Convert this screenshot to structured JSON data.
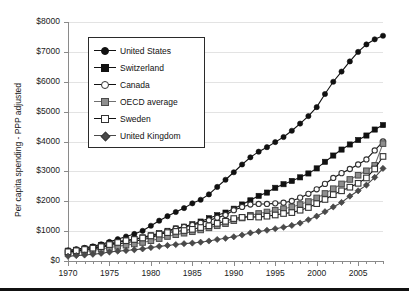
{
  "chart_data": {
    "type": "line",
    "title": "",
    "xlabel": "",
    "ylabel": "Per capita spending - PPP adjusted",
    "xlim": [
      1970,
      2008
    ],
    "ylim": [
      0,
      8000
    ],
    "grid": true,
    "legend_position": "upper-left-inside",
    "y_tick_labels": [
      "$8000",
      "$7000",
      "$6000",
      "$5000",
      "$4000",
      "$3000",
      "$2000",
      "$1000",
      "$0"
    ],
    "y_tick_values": [
      8000,
      7000,
      6000,
      5000,
      4000,
      3000,
      2000,
      1000,
      0
    ],
    "x_tick_labels": [
      "1970",
      "1975",
      "1980",
      "1985",
      "1990",
      "1995",
      "2000",
      "2005"
    ],
    "x_tick_values": [
      1970,
      1975,
      1980,
      1985,
      1990,
      1995,
      2000,
      2005
    ],
    "x": [
      1970,
      1971,
      1972,
      1973,
      1974,
      1975,
      1976,
      1977,
      1978,
      1979,
      1980,
      1981,
      1982,
      1983,
      1984,
      1985,
      1986,
      1987,
      1988,
      1989,
      1990,
      1991,
      1992,
      1993,
      1994,
      1995,
      1996,
      1997,
      1998,
      1999,
      2000,
      2001,
      2002,
      2003,
      2004,
      2005,
      2006,
      2007,
      2008
    ],
    "series": [
      {
        "name": "United States",
        "marker": "filled-circle",
        "color": "#111111",
        "values": [
          355,
          395,
          440,
          490,
          560,
          640,
          730,
          820,
          905,
          1010,
          1180,
          1350,
          1500,
          1640,
          1770,
          1930,
          2050,
          2230,
          2480,
          2720,
          2970,
          3230,
          3470,
          3660,
          3810,
          3980,
          4150,
          4360,
          4600,
          4850,
          5150,
          5590,
          6000,
          6340,
          6680,
          7000,
          7250,
          7420,
          7540
        ]
      },
      {
        "name": "Switzerland",
        "marker": "filled-square",
        "color": "#111111",
        "values": [
          345,
          375,
          420,
          470,
          530,
          600,
          650,
          690,
          730,
          790,
          860,
          930,
          1010,
          1090,
          1150,
          1230,
          1320,
          1430,
          1530,
          1620,
          1750,
          1890,
          2030,
          2180,
          2290,
          2450,
          2570,
          2680,
          2800,
          2930,
          3100,
          3320,
          3530,
          3730,
          3900,
          4050,
          4200,
          4400,
          4550
        ]
      },
      {
        "name": "Canada",
        "marker": "open-circle",
        "color": "#333333",
        "values": [
          300,
          330,
          360,
          400,
          450,
          520,
          570,
          610,
          660,
          710,
          780,
          880,
          990,
          1080,
          1140,
          1200,
          1280,
          1360,
          1450,
          1540,
          1700,
          1810,
          1890,
          1910,
          1910,
          1930,
          1950,
          2010,
          2120,
          2250,
          2400,
          2580,
          2780,
          2940,
          3080,
          3230,
          3400,
          3700,
          4000
        ]
      },
      {
        "name": "OECD average",
        "marker": "gray-square",
        "color": "#8e8e8e",
        "values": [
          265,
          290,
          320,
          355,
          400,
          450,
          490,
          530,
          570,
          620,
          680,
          750,
          820,
          880,
          930,
          980,
          1040,
          1110,
          1180,
          1250,
          1350,
          1440,
          1530,
          1590,
          1640,
          1700,
          1750,
          1810,
          1890,
          1990,
          2110,
          2260,
          2420,
          2580,
          2730,
          2870,
          3020,
          3200,
          3930
        ]
      },
      {
        "name": "Sweden",
        "marker": "open-square",
        "color": "#333333",
        "values": [
          310,
          345,
          385,
          430,
          480,
          550,
          620,
          680,
          720,
          770,
          840,
          900,
          950,
          990,
          1020,
          1060,
          1120,
          1180,
          1260,
          1330,
          1420,
          1460,
          1480,
          1470,
          1500,
          1540,
          1590,
          1620,
          1700,
          1790,
          1920,
          2060,
          2220,
          2350,
          2470,
          2600,
          2780,
          3080,
          3500
        ]
      },
      {
        "name": "United Kingdom",
        "marker": "filled-diamond",
        "color": "#4a4a4a",
        "values": [
          160,
          180,
          200,
          225,
          255,
          300,
          330,
          350,
          375,
          405,
          450,
          490,
          520,
          550,
          580,
          600,
          630,
          670,
          720,
          760,
          810,
          870,
          940,
          990,
          1030,
          1080,
          1130,
          1190,
          1270,
          1380,
          1500,
          1650,
          1810,
          1960,
          2170,
          2350,
          2540,
          2800,
          3100
        ]
      }
    ]
  },
  "legend": {
    "items": [
      {
        "label": "United States"
      },
      {
        "label": "Switzerland"
      },
      {
        "label": "Canada"
      },
      {
        "label": "OECD average"
      },
      {
        "label": "Sweden"
      },
      {
        "label": "United Kingdom"
      }
    ]
  }
}
